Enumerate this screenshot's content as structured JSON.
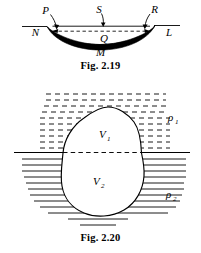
{
  "document": {
    "type": "physics-textbook-figures",
    "background_color": "#ffffff",
    "ink_color": "#000000"
  },
  "figures": [
    {
      "id": "fig-2-19",
      "caption": "Fig. 2.19",
      "description": "Lens shaped meniscus / curved dark band between a surface line, with labelled points",
      "labels": [
        {
          "name": "P",
          "text": "P"
        },
        {
          "name": "S",
          "text": "S"
        },
        {
          "name": "R",
          "text": "R"
        },
        {
          "name": "N",
          "text": "N"
        },
        {
          "name": "Q",
          "text": "Q"
        },
        {
          "name": "L",
          "text": "L"
        },
        {
          "name": "M",
          "text": "M"
        }
      ]
    },
    {
      "id": "fig-2-20",
      "caption": "Fig. 2.20",
      "description": "Irregular blob straddling a fluid interface; upper part in medium of density rho-1, lower part in medium of density rho-2",
      "labels": [
        {
          "name": "V1",
          "text": "V",
          "subscript": "1"
        },
        {
          "name": "V2",
          "text": "V",
          "subscript": "2"
        },
        {
          "name": "rho1",
          "text": "ρ",
          "subscript": "1"
        },
        {
          "name": "rho2",
          "text": "ρ",
          "subscript": "2"
        }
      ]
    }
  ]
}
